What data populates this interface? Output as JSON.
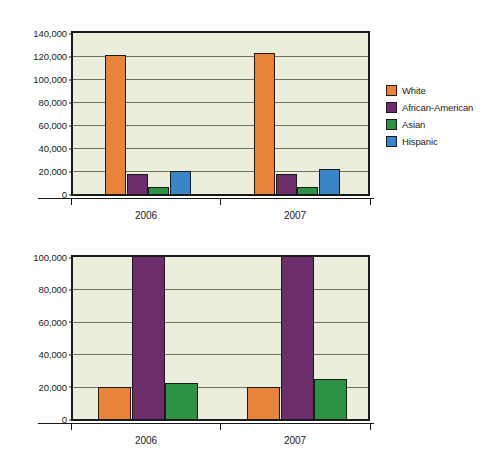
{
  "chart_data": [
    {
      "id": "top",
      "type": "bar",
      "title": "",
      "xlabel": "",
      "ylabel": "",
      "categories": [
        "2006",
        "2007"
      ],
      "ylim": [
        0,
        140000
      ],
      "yticks": [
        "0",
        "20,000",
        "40,000",
        "60,000",
        "80,000",
        "100,000",
        "120,000",
        "140,000"
      ],
      "ytick_values": [
        0,
        20000,
        40000,
        60000,
        80000,
        100000,
        120000,
        140000
      ],
      "grid": true,
      "legend_position": "right",
      "series": [
        {
          "name": "White",
          "color": "#e8833a",
          "values": [
            121000,
            123000
          ]
        },
        {
          "name": "African-American",
          "color": "#6b2d6b",
          "values": [
            17000,
            17000
          ]
        },
        {
          "name": "Asian",
          "color": "#2e9245",
          "values": [
            6500,
            6500
          ]
        },
        {
          "name": "Hispanic",
          "color": "#3a85c8",
          "values": [
            19800,
            22000
          ]
        }
      ]
    },
    {
      "id": "bottom",
      "type": "bar",
      "title": "",
      "xlabel": "",
      "ylabel": "",
      "categories": [
        "2006",
        "2007"
      ],
      "ylim": [
        0,
        100000
      ],
      "yticks": [
        "0",
        "20,000",
        "40,000",
        "60,000",
        "80,000",
        "100,000"
      ],
      "ytick_values": [
        0,
        20000,
        40000,
        60000,
        80000,
        100000
      ],
      "grid": true,
      "legend_position": "right",
      "series": [
        {
          "name": "Age 16-24",
          "color": "#e8833a",
          "values": [
            20000,
            20000
          ]
        },
        {
          "name": "Age 25-54",
          "color": "#6b2d6b",
          "values": [
            100000,
            100000
          ],
          "clipped": true
        },
        {
          "name": "Age 55 and over",
          "color": "#2e9245",
          "values": [
            22500,
            24500
          ]
        }
      ]
    }
  ],
  "colors": {
    "plot_background": "#eaeedc",
    "axis": "#1a1a1a",
    "gridline": "#6f7459",
    "page_background": "#ffffff"
  }
}
